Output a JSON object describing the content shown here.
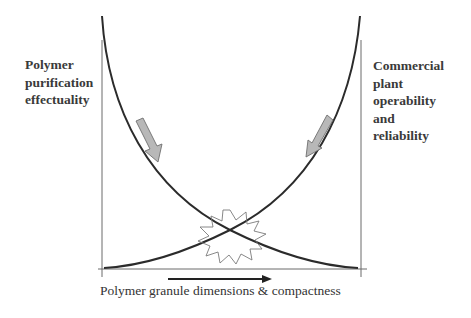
{
  "diagram": {
    "left_label": "Polymer\npurification\neffectuality",
    "right_label": "Commercial\nplant\noperability\nand\nreliability",
    "x_axis_label": "Polymer granule dimensions & compactness",
    "colors": {
      "curve": "#2b2b2b",
      "axis": "#555555",
      "arrow_fill": "#b5b5b5",
      "arrow_stroke": "#6f6f6f",
      "starburst_stroke": "#808080",
      "text": "#3a3a3a"
    },
    "curves": [
      {
        "name": "decreasing",
        "description": "Purification effectuality decreases as granule size/compactness increases"
      },
      {
        "name": "increasing",
        "description": "Plant operability and reliability increases as granule size/compactness increases"
      }
    ],
    "annotations": [
      {
        "type": "down-arrow",
        "near": "decreasing curve"
      },
      {
        "type": "down-arrow",
        "near": "increasing curve"
      },
      {
        "type": "starburst",
        "near": "curve intersection (optimum)"
      },
      {
        "type": "right-arrow",
        "near": "x-axis direction"
      }
    ]
  }
}
